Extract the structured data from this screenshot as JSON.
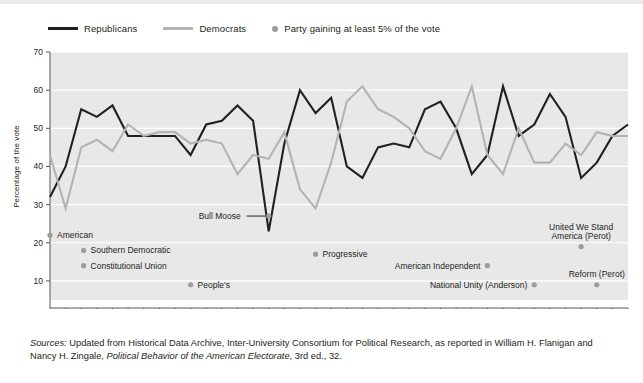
{
  "legend": {
    "items": [
      {
        "label": "Republicans",
        "type": "line",
        "color": "#231f20",
        "name": "legend-republicans"
      },
      {
        "label": "Democrats",
        "type": "line",
        "color": "#b3b3b3",
        "name": "legend-democrats"
      },
      {
        "label": "Party gaining at least 5% of the vote",
        "type": "dot",
        "color": "#9c9c9c",
        "name": "legend-third-party"
      }
    ]
  },
  "axes": {
    "ylabel": "Percentage of the vote",
    "yticks": [
      70,
      60,
      50,
      40,
      30,
      20,
      10
    ],
    "ylim": [
      5,
      70
    ],
    "xticks_top": [
      1856,
      1864,
      1872,
      1880,
      1888,
      1896,
      1904,
      1912,
      1920,
      1928,
      1936,
      1944,
      1952,
      1960,
      1968,
      1976,
      1984,
      1992,
      2000
    ],
    "xticks_bottom": [
      1860,
      1868,
      1876,
      1884,
      1892,
      1900,
      1908,
      1916,
      1924,
      1932,
      1940,
      1948,
      1956,
      1964,
      1972,
      1980,
      1988,
      1996,
      2004
    ],
    "xlim": [
      1856,
      2004
    ]
  },
  "source": {
    "prefix": "Sources:",
    "line1": " Updated from Historical Data Archive, Inter-University Consortium for Political Research, as",
    "line2a": "reported in William H. Flanigan and Nancy H. Zingale, ",
    "line2b": "Political Behavior of the American Electorate",
    "line2c": ", 3rd",
    "line3": "ed., 32."
  },
  "chart_data": {
    "type": "line",
    "title": "",
    "xlabel": "",
    "ylabel": "Percentage of the vote",
    "ylim": [
      5,
      70
    ],
    "xlim": [
      1856,
      2004
    ],
    "grid": true,
    "legend_position": "above-plot",
    "x": [
      1856,
      1860,
      1864,
      1868,
      1872,
      1876,
      1880,
      1884,
      1888,
      1892,
      1896,
      1900,
      1904,
      1908,
      1912,
      1916,
      1920,
      1924,
      1928,
      1932,
      1936,
      1940,
      1944,
      1948,
      1952,
      1956,
      1960,
      1964,
      1968,
      1972,
      1976,
      1980,
      1984,
      1988,
      1992,
      1996,
      2000,
      2004
    ],
    "series": [
      {
        "name": "Republicans",
        "color": "#231f20",
        "values": [
          32,
          40,
          55,
          53,
          56,
          48,
          48,
          48,
          48,
          43,
          51,
          52,
          56,
          52,
          23,
          46,
          60,
          54,
          58,
          40,
          37,
          45,
          46,
          45,
          55,
          57,
          50,
          38,
          43,
          61,
          48,
          51,
          59,
          53,
          37,
          41,
          48,
          51
        ]
      },
      {
        "name": "Democrats",
        "color": "#b3b3b3",
        "values": [
          43,
          29,
          45,
          47,
          44,
          51,
          48,
          49,
          49,
          46,
          47,
          46,
          38,
          43,
          42,
          49,
          34,
          29,
          41,
          57,
          61,
          55,
          53,
          50,
          44,
          42,
          50,
          61,
          43,
          38,
          50,
          41,
          41,
          46,
          43,
          49,
          48,
          48
        ]
      }
    ],
    "annotations": [
      {
        "label": "American",
        "year": 1856,
        "value": 22,
        "dot": true,
        "name": "annotation-american"
      },
      {
        "label": "Southern Democratic",
        "year": 1860,
        "value": 18,
        "dot": true,
        "name": "annotation-southern-democratic"
      },
      {
        "label": "Constitutional Union",
        "year": 1860,
        "value": 14,
        "dot": true,
        "name": "annotation-constitutional-union"
      },
      {
        "label": "People's",
        "year": 1892,
        "value": 9,
        "dot": true,
        "name": "annotation-peoples"
      },
      {
        "label": "Bull Moose",
        "year": 1912,
        "value": 27,
        "dot": true,
        "name": "annotation-bull-moose"
      },
      {
        "label": "Progressive",
        "year": 1924,
        "value": 17,
        "dot": true,
        "name": "annotation-progressive"
      },
      {
        "label": "American Independent",
        "year": 1968,
        "value": 14,
        "dot": true,
        "name": "annotation-american-independent"
      },
      {
        "label": "National Unity (Anderson)",
        "year": 1980,
        "value": 9,
        "dot": true,
        "name": "annotation-national-unity"
      },
      {
        "label": "United We Stand America (Perot)",
        "year": 1992,
        "value": 19,
        "dot": true,
        "name": "annotation-united-we-stand"
      },
      {
        "label": "Reform (Perot)",
        "year": 1996,
        "value": 9,
        "dot": true,
        "name": "annotation-reform-perot"
      }
    ]
  }
}
